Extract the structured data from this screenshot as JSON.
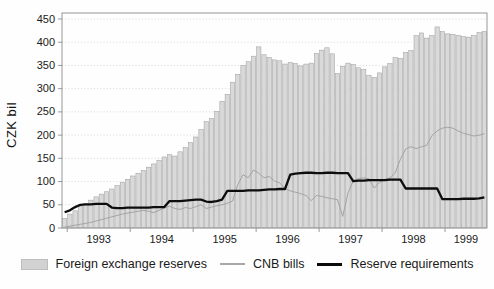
{
  "figure": {
    "y_axis_label": "CZK bil"
  },
  "colors": {
    "bar_fill": "#d9d9d9",
    "bar_stroke": "#9b9b9b",
    "cnb_bills_line": "#a3a3a3",
    "reserve_requirements_line": "#0d0d0d",
    "grid": "#c6c6c6",
    "frame": "#8e8e8e",
    "text": "#1a1a1a"
  },
  "legend": [
    {
      "label": "Foreign exchange reserves",
      "swatch": "bar"
    },
    {
      "label": "CNB bills",
      "swatch": "thin-line"
    },
    {
      "label": "Reserve requirements",
      "swatch": "thick-line"
    }
  ],
  "chart_data": {
    "type": "bar",
    "x_unit": "month",
    "start": "1992-12",
    "end": "1999-08",
    "ylabel": "CZK bil",
    "ylim": [
      0,
      450
    ],
    "y_ticks": [
      0,
      50,
      100,
      150,
      200,
      250,
      300,
      350,
      400,
      450
    ],
    "year_ticks": [
      1993,
      1994,
      1995,
      1996,
      1997,
      1998,
      1999
    ],
    "grid": "dotted-horizontal",
    "legend_position": "bottom",
    "series": [
      {
        "name": "Foreign exchange reserves",
        "type": "bar",
        "values": [
          21,
          30,
          37,
          46,
          52,
          60,
          67,
          73,
          78,
          84,
          91,
          98,
          105,
          112,
          118,
          124,
          131,
          138,
          146,
          153,
          158,
          155,
          164,
          173,
          184,
          196,
          212,
          229,
          236,
          251,
          273,
          288,
          314,
          331,
          350,
          358,
          370,
          390,
          373,
          367,
          362,
          360,
          353,
          356,
          354,
          349,
          353,
          355,
          376,
          383,
          388,
          375,
          333,
          348,
          355,
          352,
          345,
          341,
          329,
          324,
          334,
          347,
          354,
          367,
          365,
          378,
          382,
          414,
          420,
          409,
          414,
          433,
          423,
          418,
          417,
          415,
          412,
          411,
          414,
          421,
          423
        ]
      },
      {
        "name": "CNB bills",
        "type": "line",
        "values": [
          2,
          4,
          6,
          8,
          10,
          12,
          15,
          18,
          21,
          24,
          27,
          30,
          32,
          34,
          36,
          38,
          36,
          33,
          38,
          43,
          47,
          42,
          40,
          44,
          42,
          46,
          50,
          42,
          45,
          48,
          50,
          53,
          58,
          93,
          115,
          108,
          125,
          118,
          108,
          111,
          101,
          97,
          85,
          80,
          77,
          74,
          70,
          59,
          70,
          68,
          65,
          63,
          61,
          25,
          75,
          101,
          106,
          108,
          106,
          86,
          98,
          104,
          108,
          119,
          148,
          170,
          175,
          171,
          175,
          178,
          199,
          209,
          215,
          217,
          215,
          209,
          204,
          201,
          198,
          200,
          203
        ]
      },
      {
        "name": "Reserve requirements",
        "type": "line",
        "values": [
          34,
          38,
          45,
          50,
          51,
          51,
          52,
          52,
          52,
          44,
          43,
          43,
          44,
          44,
          44,
          44,
          44,
          45,
          45,
          45,
          58,
          58,
          58,
          59,
          60,
          61,
          61,
          57,
          56,
          58,
          61,
          80,
          80,
          80,
          80,
          81,
          81,
          81,
          82,
          83,
          83,
          84,
          84,
          115,
          117,
          118,
          119,
          119,
          118,
          118,
          119,
          119,
          118,
          118,
          118,
          101,
          102,
          102,
          103,
          103,
          103,
          103,
          104,
          104,
          104,
          85,
          85,
          85,
          85,
          85,
          85,
          85,
          62,
          62,
          62,
          62,
          63,
          63,
          63,
          64,
          66
        ]
      }
    ]
  }
}
